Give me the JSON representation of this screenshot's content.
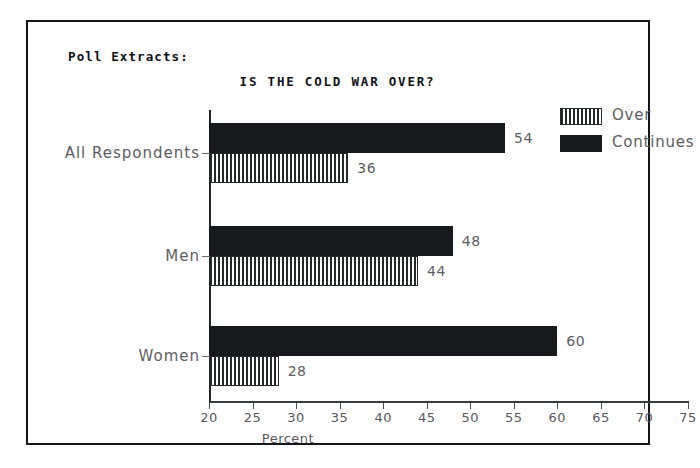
{
  "panel": {
    "corner_label": "Poll Extracts:"
  },
  "chart_data": {
    "type": "bar",
    "orientation": "horizontal",
    "title": "IS THE COLD WAR OVER?",
    "xlabel": "Percent",
    "ylabel": "",
    "xlim": [
      20,
      75
    ],
    "xticks": [
      20,
      25,
      30,
      35,
      40,
      45,
      50,
      55,
      60,
      65,
      70,
      75
    ],
    "xticklabels": [
      "20",
      "25",
      "30",
      "35",
      "40",
      "45",
      "50",
      "55",
      "60",
      "65",
      "70",
      "75"
    ],
    "grid": false,
    "legend_position": "top-right",
    "categories": [
      "All Respondents",
      "Men",
      "Women"
    ],
    "series": [
      {
        "name": "Continues",
        "style": "solid-black",
        "color": "#18191d",
        "values": [
          54,
          48,
          60
        ]
      },
      {
        "name": "Over",
        "style": "vertical-hatch",
        "color": "#26272b",
        "values": [
          36,
          44,
          28
        ]
      }
    ],
    "bars": [
      {
        "category": "All Respondents",
        "series": "Continues",
        "value": 54,
        "label": "54"
      },
      {
        "category": "All Respondents",
        "series": "Over",
        "value": 36,
        "label": "36"
      },
      {
        "category": "Men",
        "series": "Continues",
        "value": 48,
        "label": "48"
      },
      {
        "category": "Men",
        "series": "Over",
        "value": 44,
        "label": "44"
      },
      {
        "category": "Women",
        "series": "Continues",
        "value": 60,
        "label": "60"
      },
      {
        "category": "Women",
        "series": "Over",
        "value": 28,
        "label": "28"
      }
    ]
  }
}
